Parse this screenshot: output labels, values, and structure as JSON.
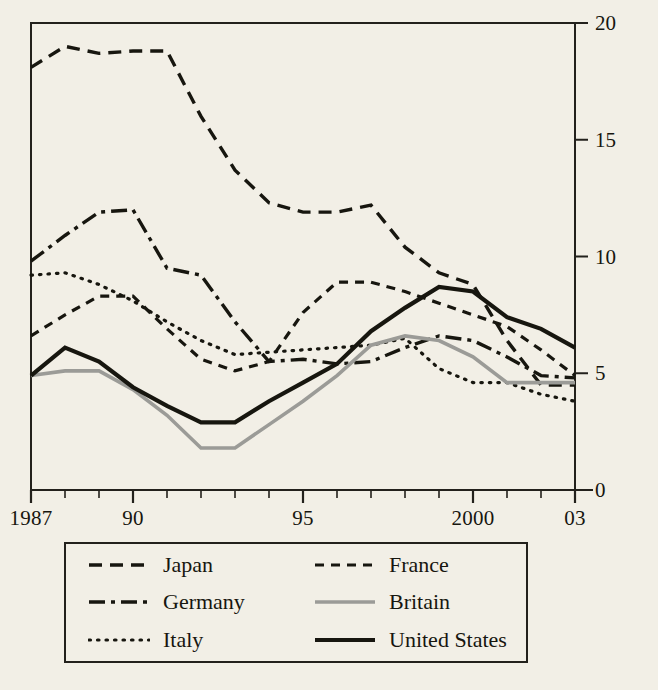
{
  "chart_data": {
    "type": "line",
    "title": "",
    "subtitle": "",
    "xlabel": "",
    "ylabel": "",
    "x": [
      1987,
      1988,
      1989,
      1990,
      1991,
      1992,
      1993,
      1994,
      1995,
      1996,
      1997,
      1998,
      1999,
      2000,
      2001,
      2002,
      2003
    ],
    "xlim": [
      1987,
      2003
    ],
    "ylim": [
      0,
      20
    ],
    "yticks": [
      0,
      5,
      10,
      15,
      20
    ],
    "xtick_positions": [
      1987,
      1990,
      1995,
      2000,
      2003
    ],
    "xtick_labels": [
      "1987",
      "90",
      "95",
      "2000",
      "03"
    ],
    "grid": false,
    "legend_position": "below-axes",
    "series": [
      {
        "name": "Japan",
        "style": "dashed",
        "color": "#17160f",
        "width": 3.4,
        "dash": "13,8",
        "values": [
          18.1,
          19.0,
          18.7,
          18.8,
          18.8,
          16.0,
          13.7,
          12.3,
          11.9,
          11.9,
          12.2,
          10.4,
          9.3,
          8.8,
          6.4,
          4.5,
          4.5
        ]
      },
      {
        "name": "Germany",
        "style": "dash-dot",
        "color": "#17160f",
        "width": 3.4,
        "dash": "16,6,4,6",
        "values": [
          9.8,
          10.9,
          11.9,
          12.0,
          9.5,
          9.2,
          7.2,
          5.5,
          5.6,
          5.4,
          5.5,
          6.1,
          6.6,
          6.4,
          5.7,
          4.9,
          4.8
        ]
      },
      {
        "name": "Italy",
        "style": "dotted",
        "color": "#17160f",
        "width": 3.2,
        "dash": "1.5,7",
        "values": [
          9.2,
          9.3,
          8.8,
          8.1,
          7.2,
          6.4,
          5.8,
          5.9,
          6.0,
          6.1,
          6.2,
          6.5,
          5.2,
          4.6,
          4.6,
          4.1,
          3.8
        ]
      },
      {
        "name": "France",
        "style": "dashed-short",
        "color": "#17160f",
        "width": 3.2,
        "dash": "9,7",
        "values": [
          6.6,
          7.5,
          8.3,
          8.3,
          6.9,
          5.6,
          5.1,
          5.5,
          7.6,
          8.9,
          8.9,
          8.5,
          8.0,
          7.5,
          7.0,
          6.0,
          4.9
        ]
      },
      {
        "name": "Britain",
        "style": "solid",
        "color": "#9b9b97",
        "width": 3.6,
        "dash": "",
        "values": [
          4.9,
          5.1,
          5.1,
          4.3,
          3.2,
          1.8,
          1.8,
          2.8,
          3.8,
          4.9,
          6.2,
          6.6,
          6.4,
          5.7,
          4.6,
          4.6,
          4.6
        ]
      },
      {
        "name": "United States",
        "style": "solid-thick",
        "color": "#17160f",
        "width": 4.2,
        "dash": "",
        "values": [
          4.9,
          6.1,
          5.5,
          4.4,
          3.6,
          2.9,
          2.9,
          3.8,
          4.6,
          5.4,
          6.8,
          7.8,
          8.7,
          8.5,
          7.4,
          6.9,
          6.1
        ]
      }
    ]
  },
  "axes": {
    "y_tick_labels": [
      "0",
      "5",
      "10",
      "15",
      "20"
    ],
    "x_tick_labels": [
      "1987",
      "90",
      "95",
      "2000",
      "03"
    ]
  },
  "legend": {
    "items": [
      {
        "label": "Japan",
        "key": "Japan"
      },
      {
        "label": "France",
        "key": "France"
      },
      {
        "label": "Germany",
        "key": "Germany"
      },
      {
        "label": "Britain",
        "key": "Britain"
      },
      {
        "label": "Italy",
        "key": "Italy"
      },
      {
        "label": "United States",
        "key": "United States"
      }
    ]
  }
}
